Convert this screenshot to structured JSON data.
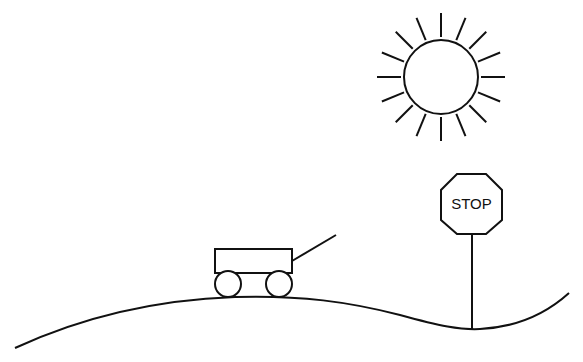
{
  "scene": {
    "title": "",
    "background": "#ffffff",
    "stroke_color": "#111111",
    "sun": {
      "cx": 441,
      "cy": 77,
      "r": 37,
      "ray_count": 16,
      "ray_inner": 40,
      "ray_outer": 64
    },
    "stop_sign": {
      "label": "STOP",
      "points": "457,174 486,174 502,190 502,220 486,234 457,234 441,220 441,190",
      "pole": {
        "x": 472,
        "y1": 234,
        "y2": 329
      },
      "text_x": 471.5,
      "text_y": 209
    },
    "wagon": {
      "box": {
        "x": 215,
        "y": 249,
        "width": 77,
        "height": 24
      },
      "handle": {
        "x1": 292,
        "y1": 261,
        "x2": 336,
        "y2": 235
      },
      "wheels": [
        {
          "cx": 228,
          "cy": 284,
          "r": 13
        },
        {
          "cx": 279,
          "cy": 284,
          "r": 13
        }
      ]
    },
    "hill": {
      "path": "M15,348 C80,318 150,300 235,297 C300,295 350,302 400,315 C440,326 460,330 480,329 C520,327 548,312 569,293"
    }
  }
}
